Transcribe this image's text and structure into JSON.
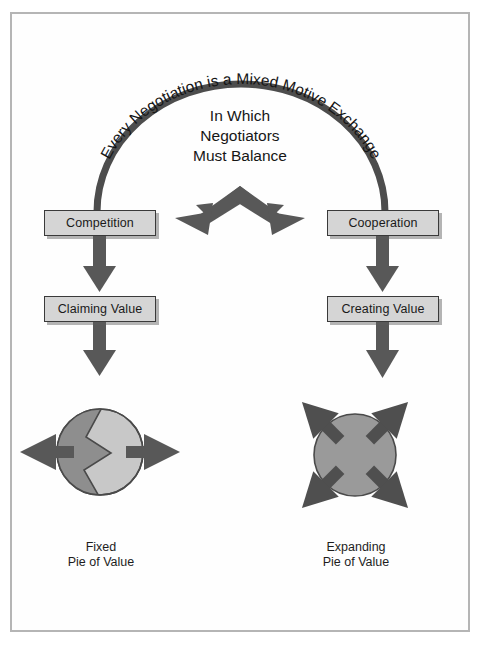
{
  "figure": {
    "arc_heading": "Every Negotiation is a Mixed Motive Exchange",
    "center_heading": {
      "line1": "In Which",
      "line2": "Negotiators",
      "line3": "Must Balance"
    },
    "branches": {
      "left": {
        "mode_label": "Competition",
        "value_label": "Claiming Value",
        "pie_caption_line1": "Fixed",
        "pie_caption_line2": "Pie of Value"
      },
      "right": {
        "mode_label": "Cooperation",
        "value_label": "Creating Value",
        "pie_caption_line1": "Expanding",
        "pie_caption_line2": "Pie of Value"
      }
    },
    "icons": {
      "arc_connector": "arc-curve",
      "split_arrow": "double-headed-v-arrow",
      "down_arrow": "arrow-down",
      "horizontal_split_arrows": "arrow-left-right",
      "radial_arrows": "arrows-expand-diagonal",
      "fixed_pie": "circle-split-zigzag",
      "expanding_pie": "circle-solid"
    },
    "colors": {
      "frame_border": "#b5b5b5",
      "box_fill": "#d5d5d5",
      "box_border": "#3a3a3a",
      "arrow_gray": "#585858",
      "arc_gray": "#4d4d4d",
      "pie_dark": "#8e8e8e",
      "pie_light": "#c8c8c8",
      "pie_solid": "#9a9a9a",
      "text": "#1a1a1a",
      "background": "#ffffff"
    }
  }
}
